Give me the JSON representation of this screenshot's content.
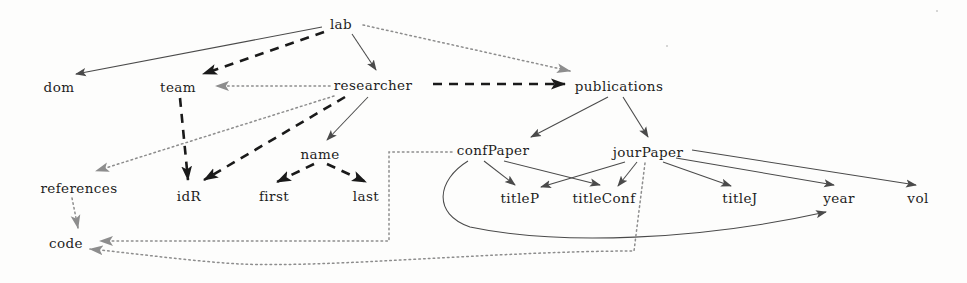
{
  "diagram": {
    "type": "directed-graph",
    "title": "",
    "canvas": {
      "width": 967,
      "height": 283,
      "background": "#fdfdfc"
    },
    "colors": {
      "solid_edge": "#4a4a4a",
      "dashed_edge": "#1a1a1a",
      "dotted_edge": "#8d8d8d",
      "label_text": "#1d1d1d"
    },
    "nodes": [
      {
        "id": "lab",
        "label": "lab",
        "x": 341,
        "y": 24
      },
      {
        "id": "dom",
        "label": "dom",
        "x": 59,
        "y": 87
      },
      {
        "id": "team",
        "label": "team",
        "x": 178,
        "y": 87
      },
      {
        "id": "researcher",
        "label": "researcher",
        "x": 373,
        "y": 85
      },
      {
        "id": "publications",
        "label": "publications",
        "x": 619,
        "y": 86
      },
      {
        "id": "references",
        "label": "references",
        "x": 79,
        "y": 188
      },
      {
        "id": "name",
        "label": "name",
        "x": 320,
        "y": 154
      },
      {
        "id": "confPaper",
        "label": "confPaper",
        "x": 493,
        "y": 150
      },
      {
        "id": "jourPaper",
        "label": "jourPaper",
        "x": 648,
        "y": 152
      },
      {
        "id": "idR",
        "label": "idR",
        "x": 189,
        "y": 196
      },
      {
        "id": "first",
        "label": "first",
        "x": 274,
        "y": 196
      },
      {
        "id": "last",
        "label": "last",
        "x": 366,
        "y": 196
      },
      {
        "id": "titleP",
        "label": "titleP",
        "x": 520,
        "y": 198
      },
      {
        "id": "titleConf",
        "label": "titleConf",
        "x": 604,
        "y": 198
      },
      {
        "id": "titleJ",
        "label": "titleJ",
        "x": 740,
        "y": 198
      },
      {
        "id": "year",
        "label": "year",
        "x": 839,
        "y": 198
      },
      {
        "id": "vol",
        "label": "vol",
        "x": 918,
        "y": 198
      },
      {
        "id": "code",
        "label": "code",
        "x": 66,
        "y": 243
      }
    ],
    "edges": [
      {
        "from": "lab",
        "to": "dom",
        "style": "solid"
      },
      {
        "from": "lab",
        "to": "team",
        "style": "dashed"
      },
      {
        "from": "lab",
        "to": "researcher",
        "style": "solid"
      },
      {
        "from": "lab",
        "to": "publications",
        "style": "dotted"
      },
      {
        "from": "researcher",
        "to": "publications",
        "style": "dashed"
      },
      {
        "from": "researcher",
        "to": "team",
        "style": "dotted"
      },
      {
        "from": "researcher",
        "to": "references",
        "style": "dotted"
      },
      {
        "from": "researcher",
        "to": "idR",
        "style": "dashed"
      },
      {
        "from": "researcher",
        "to": "name",
        "style": "solid"
      },
      {
        "from": "team",
        "to": "idR",
        "style": "dashed"
      },
      {
        "from": "name",
        "to": "first",
        "style": "dashed"
      },
      {
        "from": "name",
        "to": "last",
        "style": "dashed"
      },
      {
        "from": "references",
        "to": "code",
        "style": "dotted"
      },
      {
        "from": "publications",
        "to": "confPaper",
        "style": "solid"
      },
      {
        "from": "publications",
        "to": "jourPaper",
        "style": "solid"
      },
      {
        "from": "confPaper",
        "to": "titleP",
        "style": "solid"
      },
      {
        "from": "confPaper",
        "to": "titleConf",
        "style": "solid"
      },
      {
        "from": "confPaper",
        "to": "year",
        "style": "solid"
      },
      {
        "from": "confPaper",
        "to": "code",
        "style": "dotted"
      },
      {
        "from": "jourPaper",
        "to": "titleP",
        "style": "solid"
      },
      {
        "from": "jourPaper",
        "to": "titleConf",
        "style": "solid"
      },
      {
        "from": "jourPaper",
        "to": "titleJ",
        "style": "solid"
      },
      {
        "from": "jourPaper",
        "to": "year",
        "style": "solid"
      },
      {
        "from": "jourPaper",
        "to": "vol",
        "style": "solid"
      },
      {
        "from": "jourPaper",
        "to": "code",
        "style": "dotted"
      }
    ]
  }
}
